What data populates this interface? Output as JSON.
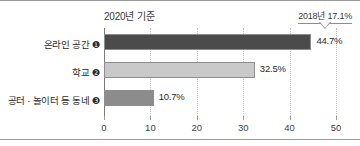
{
  "chart_data": {
    "type": "bar",
    "orientation": "horizontal",
    "title": "2020년 기준",
    "xlabel": "",
    "ylabel": "",
    "categories": [
      "온라인 공간 ❶",
      "학교 ❷",
      "공터 · 놀이터 등 동네 ❸"
    ],
    "values": [
      44.7,
      32.5,
      10.7
    ],
    "value_labels": [
      "44.7%",
      "32.5%",
      "10.7%"
    ],
    "bar_colors": [
      "#4b4b4b",
      "#c9c9c9",
      "#8c8c8c"
    ],
    "xlim": [
      0,
      50
    ],
    "xticks": [
      0,
      10,
      20,
      30,
      40,
      50
    ],
    "xtick_labels": [
      "0",
      "10",
      "20",
      "30",
      "40",
      "50"
    ],
    "grid": "vertical-dotted",
    "legend": "none",
    "annotations": [
      {
        "name": "previous-year-callout",
        "text": "2018년 17.1%",
        "points_to_category": "온라인 공간 ❶"
      }
    ]
  }
}
